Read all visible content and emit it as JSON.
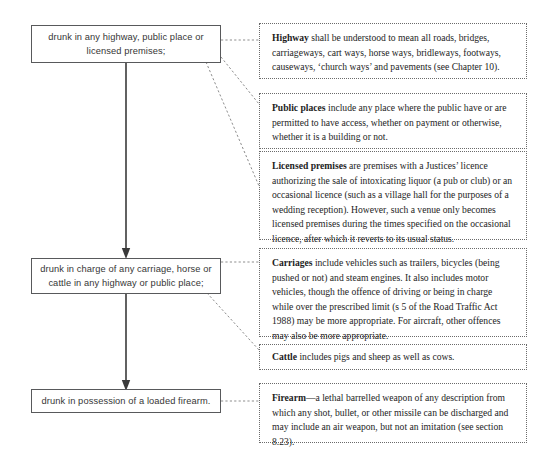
{
  "diagram": {
    "type": "flowchart-with-annotations",
    "colors": {
      "box_border": "#58595b",
      "note_border": "#6a6a6a",
      "connector": "#8d8d8d",
      "arrow": "#3a3a3a",
      "text": "#363636",
      "note_text": "#1d1d1d",
      "background": "#ffffff"
    }
  },
  "flow_steps": [
    {
      "id": "step-1",
      "label": "drunk in any highway, public place or licensed premises;"
    },
    {
      "id": "step-2",
      "label": "drunk in charge of any carriage, horse or cattle in any highway or public place;"
    },
    {
      "id": "step-3",
      "label": "drunk in possession of a loaded firearm."
    }
  ],
  "notes": [
    {
      "id": "note-highway",
      "term": "Highway",
      "body": " shall be understood to mean all roads, bridges, carriageways, cart ways, horse ways, bridleways, footways, causeways, ‘church ways’ and pavements (see Chapter 10).",
      "source_step": "step-1"
    },
    {
      "id": "note-public-places",
      "term": "Public places",
      "body": " include any place where the public have or are permitted to have access, whether on payment or otherwise, whether it is a building or not.",
      "source_step": "step-1"
    },
    {
      "id": "note-licensed-premises",
      "term": "Licensed premises",
      "body": " are premises with a Justices’ licence authorizing the sale of intoxicating liquor (a pub or club) or an occasional licence (such as a village hall for the purposes of a wedding reception). However, such a venue only becomes licensed premises during the times specified on the occasional licence, after which it reverts to its usual status.",
      "source_step": "step-1"
    },
    {
      "id": "note-carriages",
      "term": "Carriages",
      "body": " include vehicles such as trailers, bicycles (being pushed or not) and steam engines. It also includes motor vehicles, though the offence of driving or being in charge while over the prescribed limit (s 5 of the Road Traffic Act 1988) may be more appropriate. For aircraft, other offences may also be more appropriate.",
      "source_step": "step-2"
    },
    {
      "id": "note-cattle",
      "term": "Cattle",
      "body": " includes pigs and sheep as well as cows.",
      "source_step": "step-2"
    },
    {
      "id": "note-firearm",
      "term": "Firearm",
      "body": "—a lethal barrelled weapon of any description from which any shot, bullet, or other missile can be discharged and  may include an air weapon, but not an imitation (see section 8.23).",
      "source_step": "step-3"
    }
  ]
}
